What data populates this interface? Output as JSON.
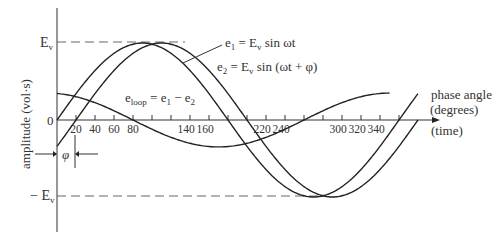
{
  "chart_data": {
    "type": "line",
    "title": "",
    "xlabel": "phase angle (degrees)",
    "xlabel_line1": "phase angle",
    "xlabel_line2": "(degrees)",
    "xlabel_secondary": "(time)",
    "ylabel": "amplitude (vol·s)",
    "xlim": [
      0,
      380
    ],
    "ylim": [
      -1,
      1
    ],
    "y_tick_labels": {
      "top": "E",
      "top_sub": "v",
      "zero": "0",
      "bottom": "− E",
      "bottom_sub": "v"
    },
    "x_ticks": [
      20,
      40,
      60,
      80,
      100,
      120,
      140,
      160,
      180,
      200,
      220,
      240,
      260,
      280,
      300,
      320,
      340,
      360
    ],
    "x_tick_labels": [
      {
        "value": 20,
        "label": "20"
      },
      {
        "value": 40,
        "label": "40"
      },
      {
        "value": 60,
        "label": "60"
      },
      {
        "value": 80,
        "label": "80"
      },
      {
        "value": 140,
        "label": "140"
      },
      {
        "value": 160,
        "label": "160"
      },
      {
        "value": 220,
        "label": "220"
      },
      {
        "value": 240,
        "label": "240"
      },
      {
        "value": 300,
        "label": "300"
      },
      {
        "value": 320,
        "label": "320"
      },
      {
        "value": 340,
        "label": "340"
      }
    ],
    "phase_shift_deg": 20,
    "phi_label": "φ",
    "series": [
      {
        "name": "e1",
        "formula": "e1 = Ev sin ωt",
        "amplitude": 1,
        "phase_deg": 0,
        "x_range": [
          0,
          380
        ]
      },
      {
        "name": "e2",
        "formula": "e2 = Ev sin (ωt + φ)",
        "amplitude": 1,
        "phase_deg": -20,
        "x_range": [
          0,
          380
        ]
      },
      {
        "name": "eloop",
        "formula": "eloop = e1 − e2",
        "amplitude": 0.35,
        "phase_deg": 100,
        "x_range": [
          0,
          350
        ]
      }
    ],
    "annotations": {
      "e1": {
        "pre": "e",
        "sub": "1",
        "post": " = E",
        "sub2": "v",
        "tail": " sin ωt"
      },
      "e2": {
        "pre": "e",
        "sub": "2",
        "post": " = E",
        "sub2": "v",
        "tail": " sin (ωt + φ)"
      },
      "eloop": {
        "pre": "e",
        "sub": "loop",
        "post": " = e",
        "sub2": "1",
        "tail": " − e",
        "sub3": "2"
      }
    },
    "grid": false,
    "legend": "none"
  }
}
